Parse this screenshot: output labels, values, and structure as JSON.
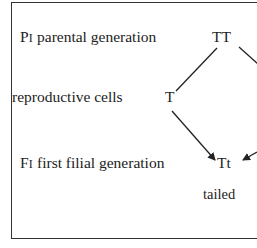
{
  "diagram": {
    "rows": [
      {
        "prefix": "P",
        "sub": "I",
        "label": " parental generation",
        "genotype": "TT"
      },
      {
        "prefix": "",
        "sub": "",
        "label": "reproductive cells",
        "genotype": "T"
      },
      {
        "prefix": "F",
        "sub": "I",
        "label": " first filial generation",
        "genotype": "Tt"
      }
    ],
    "phenotype": "tailed",
    "colors": {
      "ink": "#222222",
      "border": "#333333",
      "background": "#ffffff"
    }
  }
}
